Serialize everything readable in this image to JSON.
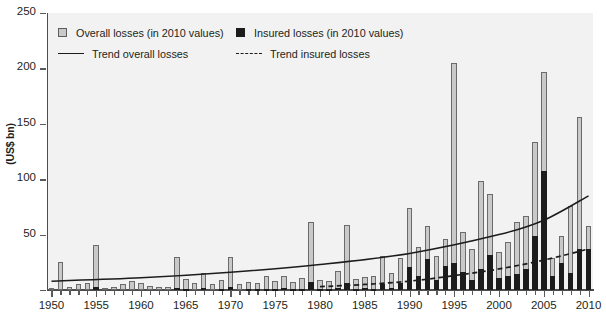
{
  "chart_data": {
    "type": "bar",
    "title": "",
    "subtitle": "",
    "xlabel": "",
    "ylabel": "(US$ bn)",
    "ylim": [
      0,
      250
    ],
    "ytick_values": [
      0,
      50,
      100,
      150,
      200,
      250
    ],
    "ytick_labels": [
      "",
      "50",
      "100",
      "150",
      "200",
      "250"
    ],
    "xlim": [
      1950,
      2010
    ],
    "xtick_labels": [
      "1950",
      "1955",
      "1960",
      "1965",
      "1970",
      "1975",
      "1980",
      "1985",
      "1990",
      "1995",
      "2000",
      "2005",
      "2010"
    ],
    "xtick_values": [
      1950,
      1955,
      1960,
      1965,
      1970,
      1975,
      1980,
      1985,
      1990,
      1995,
      2000,
      2005,
      2010
    ],
    "grid": false,
    "legend_position": "upper-left",
    "legend": [
      {
        "key": "overall",
        "label": "Overall losses (in 2010 values)",
        "marker": "square",
        "color": "#c9c9c9"
      },
      {
        "key": "insured",
        "label": "Insured losses (in 2010 values)",
        "marker": "square",
        "color": "#1c1c1c"
      },
      {
        "key": "trend_overall",
        "label": "Trend overall losses",
        "marker": "solid-line",
        "color": "#1c1c1c"
      },
      {
        "key": "trend_insured",
        "label": "Trend insured losses",
        "marker": "dashed-line",
        "color": "#1c1c1c"
      }
    ],
    "categories": [
      1950,
      1951,
      1952,
      1953,
      1954,
      1955,
      1956,
      1957,
      1958,
      1959,
      1960,
      1961,
      1962,
      1963,
      1964,
      1965,
      1966,
      1967,
      1968,
      1969,
      1970,
      1971,
      1972,
      1973,
      1974,
      1975,
      1976,
      1977,
      1978,
      1979,
      1980,
      1981,
      1982,
      1983,
      1984,
      1985,
      1986,
      1987,
      1988,
      1989,
      1990,
      1991,
      1992,
      1993,
      1994,
      1995,
      1996,
      1997,
      1998,
      1999,
      2000,
      2001,
      2002,
      2003,
      2004,
      2005,
      2006,
      2007,
      2008,
      2009,
      2010
    ],
    "series": [
      {
        "name": "Overall losses (in 2010 values)",
        "color": "#c9c9c9",
        "values": [
          2,
          25,
          3,
          5,
          6,
          41,
          2,
          3,
          5,
          8,
          6,
          4,
          3,
          3,
          30,
          10,
          6,
          15,
          5,
          9,
          30,
          5,
          7,
          6,
          13,
          8,
          13,
          7,
          11,
          61,
          9,
          8,
          17,
          59,
          10,
          12,
          13,
          31,
          15,
          29,
          74,
          39,
          58,
          31,
          46,
          205,
          52,
          37,
          98,
          87,
          34,
          43,
          61,
          67,
          134,
          197,
          29,
          49,
          76,
          156,
          58
        ],
        "stack": "total"
      },
      {
        "name": "Insured losses (in 2010 values)",
        "color": "#1c1c1c",
        "values": [
          0,
          0,
          0,
          0,
          0,
          3,
          0,
          0,
          0,
          0,
          0,
          0,
          0,
          0,
          2,
          1,
          0,
          2,
          0,
          1,
          3,
          0,
          1,
          1,
          1,
          1,
          2,
          1,
          1,
          7,
          1,
          1,
          2,
          6,
          1,
          2,
          1,
          5,
          2,
          6,
          21,
          13,
          28,
          9,
          22,
          24,
          16,
          9,
          19,
          32,
          11,
          13,
          14,
          19,
          49,
          107,
          13,
          24,
          15,
          37,
          37
        ],
        "stack": "overlay"
      }
    ],
    "trend_overall": {
      "name": "Trend overall losses",
      "style": "solid",
      "color": "#1c1c1c",
      "points": [
        [
          1950,
          8
        ],
        [
          1960,
          11
        ],
        [
          1970,
          16
        ],
        [
          1980,
          23
        ],
        [
          1990,
          33
        ],
        [
          2000,
          50
        ],
        [
          2005,
          63
        ],
        [
          2010,
          85
        ]
      ]
    },
    "trend_insured": {
      "name": "Trend insured losses",
      "style": "dashed",
      "color": "#1c1c1c",
      "points": [
        [
          1980,
          3
        ],
        [
          1985,
          5
        ],
        [
          1990,
          8
        ],
        [
          1995,
          13
        ],
        [
          2000,
          19
        ],
        [
          2005,
          27
        ],
        [
          2010,
          37
        ]
      ]
    }
  }
}
